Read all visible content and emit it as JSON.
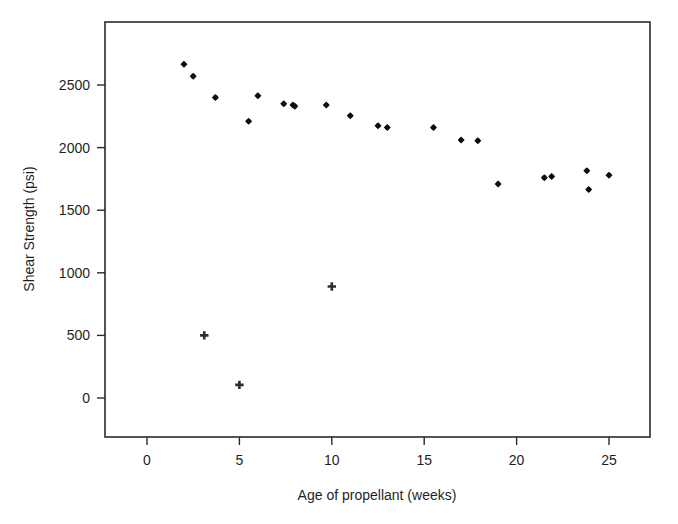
{
  "chart_data": {
    "type": "scatter",
    "title": "",
    "subtitle": "",
    "xlabel": "Age of propellant (weeks)",
    "ylabel": "Shear Strength (psi)",
    "xlim": [
      -3,
      28
    ],
    "ylim": [
      -450,
      2850
    ],
    "grid": false,
    "legend_position": "none",
    "xticks": [
      0,
      5,
      10,
      15,
      20,
      25
    ],
    "xtick_labels": [
      "0",
      "5",
      "10",
      "15",
      "20",
      "25"
    ],
    "yticks": [
      0,
      500,
      1000,
      1500,
      2000,
      2500
    ],
    "ytick_labels": [
      "0",
      "500",
      "1000",
      "1500",
      "2000",
      "2500"
    ],
    "series": [
      {
        "name": "observed",
        "marker": "diamond",
        "color": "#0d0d0d",
        "points": [
          {
            "x": 2.0,
            "y": 2665
          },
          {
            "x": 2.5,
            "y": 2570
          },
          {
            "x": 3.7,
            "y": 2400
          },
          {
            "x": 5.5,
            "y": 2210
          },
          {
            "x": 6.0,
            "y": 2415
          },
          {
            "x": 7.4,
            "y": 2350
          },
          {
            "x": 7.9,
            "y": 2340
          },
          {
            "x": 8.0,
            "y": 2330
          },
          {
            "x": 9.7,
            "y": 2340
          },
          {
            "x": 11.0,
            "y": 2255
          },
          {
            "x": 12.5,
            "y": 2175
          },
          {
            "x": 13.0,
            "y": 2160
          },
          {
            "x": 15.5,
            "y": 2160
          },
          {
            "x": 17.0,
            "y": 2060
          },
          {
            "x": 17.9,
            "y": 2055
          },
          {
            "x": 19.0,
            "y": 1710
          },
          {
            "x": 21.5,
            "y": 1760
          },
          {
            "x": 21.9,
            "y": 1770
          },
          {
            "x": 23.9,
            "y": 1665
          },
          {
            "x": 23.8,
            "y": 1815
          },
          {
            "x": 25.0,
            "y": 1780
          }
        ]
      },
      {
        "name": "outliers",
        "marker": "plus",
        "color": "#2e2e2e",
        "points": [
          {
            "x": 3.1,
            "y": 500
          },
          {
            "x": 5.0,
            "y": 105
          },
          {
            "x": 10.0,
            "y": 890
          }
        ]
      }
    ]
  },
  "axes": {
    "x_label": "Age of propellant (weeks)",
    "y_label": "Shear Strength (psi)"
  }
}
